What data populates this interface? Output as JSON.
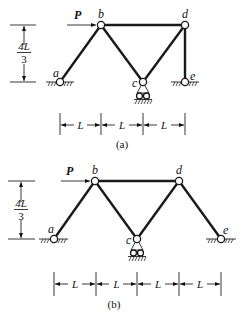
{
  "figures": [
    {
      "id": "a",
      "caption": "(a)",
      "load_label": "P",
      "height_label_num": "4L",
      "height_label_den": "3",
      "span_label": "L",
      "nodes": [
        {
          "name": "a",
          "support": "pin"
        },
        {
          "name": "b",
          "support": "none"
        },
        {
          "name": "c",
          "support": "roller"
        },
        {
          "name": "d",
          "support": "none"
        },
        {
          "name": "e",
          "support": "pin"
        }
      ],
      "members": [
        [
          "a",
          "b"
        ],
        [
          "b",
          "c"
        ],
        [
          "b",
          "d"
        ],
        [
          "c",
          "d"
        ],
        [
          "d",
          "e"
        ]
      ],
      "spans": 3
    },
    {
      "id": "b",
      "caption": "(b)",
      "load_label": "P",
      "height_label_num": "4L",
      "height_label_den": "3",
      "span_label": "L",
      "nodes": [
        {
          "name": "a",
          "support": "pin"
        },
        {
          "name": "b",
          "support": "none"
        },
        {
          "name": "c",
          "support": "roller"
        },
        {
          "name": "d",
          "support": "none"
        },
        {
          "name": "e",
          "support": "pin"
        }
      ],
      "members": [
        [
          "a",
          "b"
        ],
        [
          "b",
          "c"
        ],
        [
          "b",
          "d"
        ],
        [
          "c",
          "d"
        ],
        [
          "d",
          "e"
        ]
      ],
      "spans": 4
    }
  ]
}
